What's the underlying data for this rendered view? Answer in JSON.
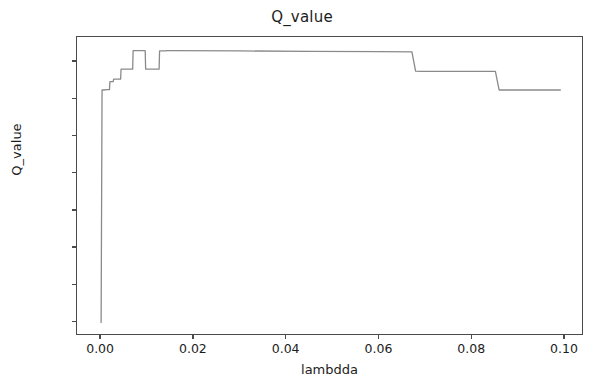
{
  "chart_data": {
    "type": "line",
    "title": "Q_value",
    "xlabel": "lambdda",
    "ylabel": "Q_value",
    "xlim": [
      -0.0052,
      0.1041
    ],
    "ylim": [
      -0.73,
      15.35
    ],
    "xticks": [
      "0.00",
      "0.02",
      "0.04",
      "0.06",
      "0.08",
      "0.10"
    ],
    "xtick_values": [
      0.0,
      0.02,
      0.04,
      0.06,
      0.08,
      0.1
    ],
    "yticks": [
      "0",
      "2",
      "4",
      "6",
      "8",
      "10",
      "12",
      "14"
    ],
    "ytick_values": [
      0,
      2,
      4,
      6,
      8,
      10,
      12,
      14
    ],
    "grid": false,
    "legend": null,
    "line_color": "#8a8a8a",
    "line_width": 1.3,
    "series": [
      {
        "name": "Q_value",
        "x": [
          0.0,
          0.0002,
          0.0005,
          0.0012,
          0.0018,
          0.0019,
          0.0026,
          0.0027,
          0.0042,
          0.0043,
          0.006,
          0.0061,
          0.0068,
          0.0069,
          0.0095,
          0.0096,
          0.0105,
          0.0106,
          0.0125,
          0.0126,
          0.014,
          0.0141,
          0.015,
          0.03,
          0.045,
          0.06,
          0.067,
          0.0678,
          0.069,
          0.078,
          0.085,
          0.0858,
          0.0868,
          0.095,
          0.099
        ],
        "y": [
          0.0,
          12.5,
          12.5,
          12.52,
          12.52,
          12.95,
          12.95,
          13.08,
          13.08,
          13.62,
          13.62,
          13.62,
          13.62,
          14.62,
          14.62,
          13.62,
          13.62,
          13.62,
          13.62,
          14.6,
          14.6,
          14.62,
          14.62,
          14.6,
          14.58,
          14.56,
          14.55,
          13.52,
          13.5,
          13.5,
          13.5,
          12.5,
          12.5,
          12.5,
          12.5
        ]
      }
    ]
  }
}
